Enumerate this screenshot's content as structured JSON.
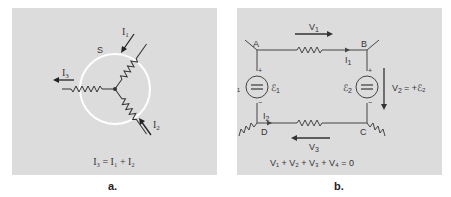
{
  "figure_a": {
    "caption": "a.",
    "surface_label": "S",
    "currents": {
      "i1": {
        "base": "I",
        "sub": "1"
      },
      "i2": {
        "base": "I",
        "sub": "2"
      },
      "i3": {
        "base": "I",
        "sub": "3"
      }
    },
    "equation": "I₃ = I₁ + I₂",
    "colors": {
      "background": "#dcdcdc",
      "surface": "#ffffff",
      "wire": "#333333"
    }
  },
  "figure_b": {
    "caption": "b.",
    "nodes": [
      "A",
      "B",
      "C",
      "D"
    ],
    "voltages": {
      "v1": {
        "base": "V",
        "sub": "1"
      },
      "v2": {
        "base": "V",
        "sub": "2",
        "expr": "= +ℰ₂"
      },
      "v3": {
        "base": "V",
        "sub": "3"
      },
      "v4": {
        "base": "V",
        "sub": "4",
        "expr": "= −ℰ₁"
      }
    },
    "currents": {
      "i1": {
        "base": "I",
        "sub": "1"
      },
      "i2": {
        "base": "I",
        "sub": "2"
      }
    },
    "sources": {
      "e1": {
        "base": "ℰ",
        "sub": "1"
      },
      "e2": {
        "base": "ℰ",
        "sub": "2"
      }
    },
    "equation": "V₁ + V₂ + V₃ + V₄ = 0",
    "colors": {
      "background": "#dcdcdc",
      "wire": "#444444"
    }
  }
}
